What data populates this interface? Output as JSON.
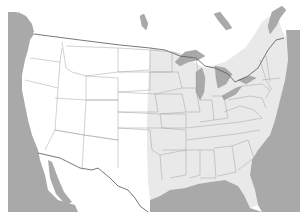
{
  "map": {
    "title": "",
    "region": "Contiguous United States",
    "highlighted_region": "Eastern United States",
    "colors": {
      "water": "#a9a9a9",
      "land_unhighlighted": "#ffffff",
      "land_highlighted": "#e9e9e9",
      "state_border": "#9a9a9a",
      "international_border": "#555555"
    },
    "labels": []
  }
}
